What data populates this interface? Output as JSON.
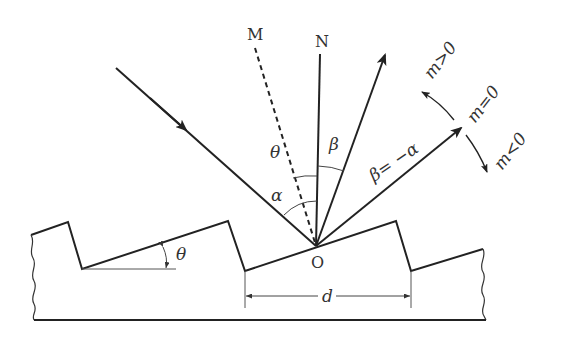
{
  "figure": {
    "labels": {
      "facet_normal": "M",
      "grating_normal": "N",
      "origin": "O",
      "blaze_angle": "θ",
      "blaze_angle_at_O": "θ",
      "incidence_angle": "α",
      "diffraction_angle": "β",
      "specular_relation": "β= −α",
      "order_positive": "m>0",
      "order_zero": "m=0",
      "order_negative": "m<0",
      "groove_spacing": "d"
    }
  }
}
